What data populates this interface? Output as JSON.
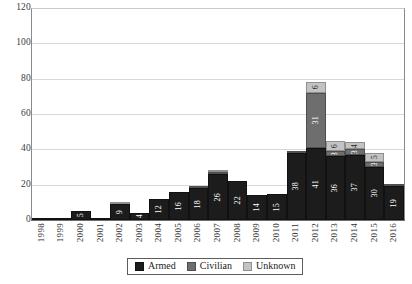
{
  "chart_data": {
    "type": "bar",
    "title": "",
    "subtitle": "",
    "xlabel": "",
    "ylabel": "",
    "stacked": true,
    "grid": true,
    "legend_position": "bottom-center",
    "ylim": [
      0,
      120
    ],
    "yticks": [
      0,
      20,
      40,
      60,
      80,
      100,
      120
    ],
    "ytick_labels": [
      "0",
      "20",
      "40",
      "60",
      "80",
      "100",
      "120"
    ],
    "categories": [
      "1998",
      "1999",
      "2000",
      "2001",
      "2002",
      "2003",
      "2004",
      "2005",
      "2006",
      "2007",
      "2008",
      "2009",
      "2010",
      "2011",
      "2012",
      "2013",
      "2014",
      "2015",
      "2016"
    ],
    "series": [
      {
        "name": "Armed",
        "color": "#1c1c1c",
        "values": [
          1,
          1,
          5,
          1,
          9,
          4,
          12,
          16,
          18,
          26,
          22,
          14,
          15,
          38,
          41,
          36,
          37,
          30,
          19
        ],
        "labels": [
          "",
          "",
          "5",
          "",
          "9",
          "4",
          "12",
          "16",
          "18",
          "26",
          "22",
          "14",
          "15",
          "38",
          "41",
          "36",
          "37",
          "30",
          "19"
        ]
      },
      {
        "name": "Civilian",
        "color": "#6e6e6e",
        "values": [
          0,
          0,
          0,
          0,
          0,
          0,
          0,
          0,
          1,
          1,
          0,
          0,
          0,
          1,
          31,
          3,
          3,
          3,
          1
        ],
        "labels": [
          "",
          "",
          "",
          "",
          "",
          "",
          "",
          "",
          "",
          "",
          "",
          "",
          "",
          "",
          "31",
          "3",
          "3",
          "3",
          ""
        ]
      },
      {
        "name": "Unknown",
        "color": "#c3c3c3",
        "values": [
          0,
          0,
          0,
          0,
          1,
          0,
          0,
          0,
          0,
          1,
          0,
          0,
          0,
          0,
          6,
          6,
          4,
          5,
          0
        ],
        "labels": [
          "",
          "",
          "",
          "",
          "",
          "",
          "",
          "",
          "",
          "",
          "",
          "",
          "",
          "",
          "6",
          "6",
          "4",
          "5",
          ""
        ]
      }
    ],
    "totals": [
      1,
      1,
      5,
      1,
      10,
      4,
      12,
      16,
      19,
      28,
      22,
      14,
      15,
      39,
      78,
      45,
      44,
      38,
      20
    ]
  },
  "legend": {
    "items": [
      {
        "label": "Armed",
        "color": "#1c1c1c",
        "swatch": "legend-swatch-armed"
      },
      {
        "label": "Civilian",
        "color": "#6e6e6e",
        "swatch": "legend-swatch-civilian"
      },
      {
        "label": "Unknown",
        "color": "#c3c3c3",
        "swatch": "legend-swatch-unknown"
      }
    ]
  }
}
